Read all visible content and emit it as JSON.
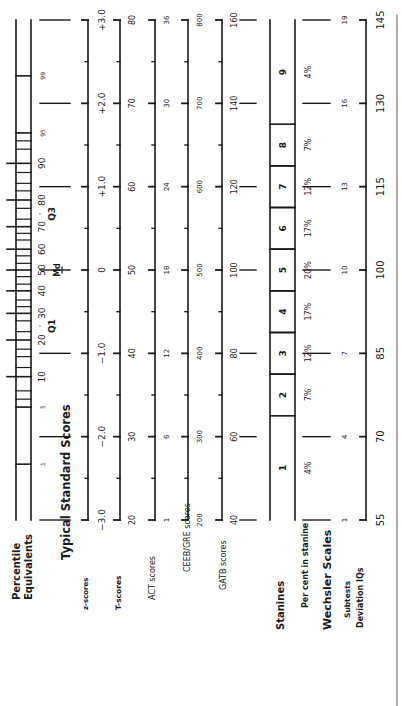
{
  "chart_data": {
    "type": "table",
    "orientation": "rotated-90ccw",
    "labels": {
      "percentile_heading": [
        "Percentile",
        "Equivalents"
      ],
      "standard_heading": "Typical Standard Scores",
      "z": "z-scores",
      "t": "T-scores",
      "act": "ACT scores",
      "ceeb": "CEEB/GRE scores",
      "gatb": "GATB scores",
      "stanines": "Stanines",
      "pct_stanine": "Per cent in stanine",
      "wechsler_heading": "Wechsler Scales",
      "subtests": "Subtests",
      "deviation": "Deviation IQs"
    },
    "percentile_labels": [
      {
        "z": -2.33,
        "text": "1"
      },
      {
        "z": -1.645,
        "text": "5"
      },
      {
        "z": -1.28,
        "text": "10"
      },
      {
        "z": -0.84,
        "text": "20"
      },
      {
        "z": -0.52,
        "text": "30"
      },
      {
        "z": -0.25,
        "text": "40"
      },
      {
        "z": 0.0,
        "text": "50"
      },
      {
        "z": 0.25,
        "text": "60"
      },
      {
        "z": 0.52,
        "text": "70"
      },
      {
        "z": 0.84,
        "text": "80"
      },
      {
        "z": 1.28,
        "text": "90"
      },
      {
        "z": 1.645,
        "text": "95"
      },
      {
        "z": 2.33,
        "text": "99"
      }
    ],
    "quartile_labels": [
      {
        "z": -0.674,
        "text": "Q1"
      },
      {
        "z": 0.0,
        "text": "Md"
      },
      {
        "z": 0.674,
        "text": "Q3"
      }
    ],
    "z_scores": {
      "ticks": [
        -3,
        -2,
        -1,
        0,
        1,
        2,
        3
      ],
      "labels": [
        "−3.0",
        "−2.0",
        "−1.0",
        "0",
        "+1.0",
        "+2.0",
        "+3.0"
      ]
    },
    "t_scores": [
      "20",
      "30",
      "40",
      "50",
      "60",
      "70",
      "80"
    ],
    "act_scores": [
      "1",
      "6",
      "12",
      "18",
      "24",
      "30",
      "36"
    ],
    "ceeb_scores": [
      "200",
      "300",
      "400",
      "500",
      "600",
      "700",
      "800"
    ],
    "gatb_scores": [
      "40",
      "60",
      "80",
      "100",
      "120",
      "140",
      "160"
    ],
    "stanines": [
      "1",
      "2",
      "3",
      "4",
      "5",
      "6",
      "7",
      "8",
      "9"
    ],
    "stanine_percents": [
      "4%",
      "7%",
      "12%",
      "17%",
      "20%",
      "17%",
      "12%",
      "7%",
      "4%"
    ],
    "wechsler_subtests": [
      "1",
      "4",
      "7",
      "10",
      "13",
      "16",
      "19"
    ],
    "deviation_iqs": [
      "55",
      "70",
      "85",
      "100",
      "115",
      "130",
      "145"
    ]
  }
}
